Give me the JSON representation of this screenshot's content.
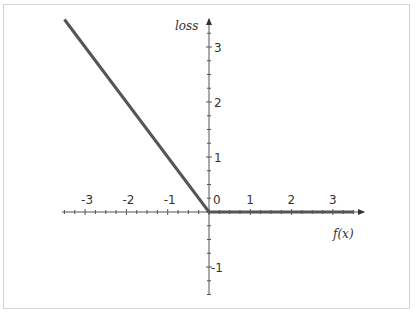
{
  "chart_data": {
    "type": "line",
    "title": "",
    "xlabel": "f(x)",
    "ylabel": "loss",
    "xlim": [
      -3.5,
      3.5
    ],
    "ylim": [
      -1.5,
      3.5
    ],
    "x_ticks": [
      "-3",
      "-2",
      "-1",
      "0",
      "1",
      "2",
      "3"
    ],
    "y_ticks": [
      "-1",
      "1",
      "2",
      "3"
    ],
    "grid": false,
    "legend": null,
    "series": [
      {
        "name": "loss",
        "x": [
          -3.5,
          0,
          3.5
        ],
        "y": [
          3.5,
          0,
          0
        ],
        "color": "#555555"
      }
    ]
  },
  "labels": {
    "x_axis": "f(x)",
    "y_axis": "loss",
    "origin": "0"
  }
}
